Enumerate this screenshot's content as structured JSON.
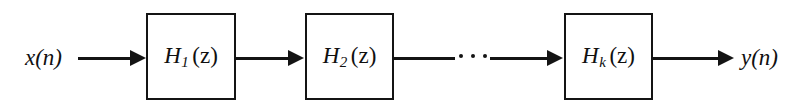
{
  "diagram": {
    "type": "block-diagram",
    "input_label": "x(n)",
    "output_label": "y(n)",
    "ellipsis": "· · ·",
    "colors": {
      "background": "#ffffff",
      "stroke": "#141414",
      "text": "#101010"
    },
    "blocks": [
      {
        "id": "block-1",
        "base": "H",
        "subscript": "1",
        "argument": "(z)",
        "full_label": "H₁(z)"
      },
      {
        "id": "block-2",
        "base": "H",
        "subscript": "2",
        "argument": "(z)",
        "full_label": "H₂(z)"
      },
      {
        "id": "block-3",
        "base": "H",
        "subscript": "k",
        "argument": "(z)",
        "full_label": "Hₖ(z)"
      }
    ],
    "connections": [
      {
        "id": "wire-in",
        "from": "x(n)",
        "to": "H1(z)",
        "arrow": true
      },
      {
        "id": "wire-1-2",
        "from": "H1(z)",
        "to": "H2(z)",
        "arrow": true
      },
      {
        "id": "wire-2-dots",
        "from": "H2(z)",
        "to": "dots",
        "arrow": false
      },
      {
        "id": "wire-dots-3",
        "from": "dots",
        "to": "Hk(z)",
        "arrow": true
      },
      {
        "id": "wire-out",
        "from": "Hk(z)",
        "to": "y(n)",
        "arrow": true
      }
    ]
  }
}
